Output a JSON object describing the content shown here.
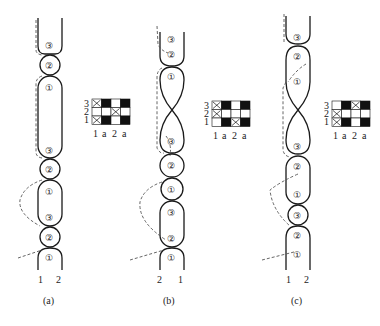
{
  "figure": {
    "panels": [
      {
        "id": "a",
        "caption": "(a)",
        "strand_labels": [
          "1",
          "2"
        ],
        "segments_top_to_bottom": [
          "③",
          "②",
          "①",
          "③",
          "②",
          "①",
          "③",
          "②",
          "①"
        ],
        "grid": {
          "row_labels": [
            "3",
            "2",
            "1"
          ],
          "col_labels": [
            "1",
            "a",
            "2",
            "a"
          ],
          "rows": [
            [
              "x",
              "b",
              "w",
              "b"
            ],
            [
              "w",
              "w",
              "x",
              "w"
            ],
            [
              "x",
              "b",
              "w",
              "b"
            ]
          ]
        }
      },
      {
        "id": "b",
        "caption": "(b)",
        "strand_labels": [
          "2",
          "1"
        ],
        "segments_top_to_bottom": [
          "③",
          "②",
          "①",
          "③",
          "②",
          "①",
          "③",
          "②",
          "①"
        ],
        "grid": {
          "row_labels": [
            "3",
            "2",
            "1"
          ],
          "col_labels": [
            "1",
            "a",
            "2",
            "a"
          ],
          "rows": [
            [
              "x",
              "b",
              "w",
              "b"
            ],
            [
              "x",
              "w",
              "w",
              "w"
            ],
            [
              "w",
              "b",
              "x",
              "b"
            ]
          ]
        }
      },
      {
        "id": "c",
        "caption": "(c)",
        "strand_labels": [
          "1",
          "2"
        ],
        "segments_top_to_bottom": [
          "③",
          "②",
          "①",
          "③",
          "②",
          "①",
          "③",
          "②",
          "①"
        ],
        "grid": {
          "row_labels": [
            "3",
            "2",
            "1"
          ],
          "col_labels": [
            "1",
            "a",
            "2",
            "a"
          ],
          "rows": [
            [
              "w",
              "b",
              "x",
              "b"
            ],
            [
              "x",
              "w",
              "w",
              "w"
            ],
            [
              "x",
              "b",
              "w",
              "b"
            ]
          ]
        }
      }
    ]
  }
}
